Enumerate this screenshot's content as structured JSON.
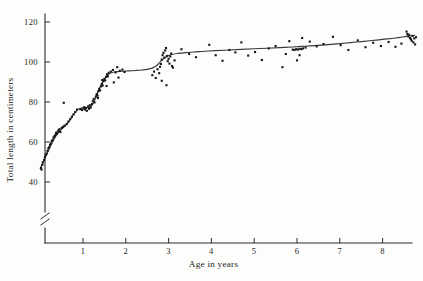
{
  "chart_data": {
    "type": "scatter",
    "title": "",
    "xlabel": "Age in years",
    "ylabel": "Total length in centimeters",
    "xlim": [
      -0.12,
      8.95
    ],
    "ylim": [
      36,
      124
    ],
    "grid": false,
    "legend": null,
    "axis_break": {
      "axis": "y",
      "below": 40,
      "symbol": "double-slash"
    },
    "xticks": [
      1,
      2,
      3,
      4,
      5,
      6,
      7,
      8
    ],
    "xtick_labels": [
      "1",
      "2",
      "3",
      "4",
      "5",
      "6",
      "7",
      "8"
    ],
    "yticks": [
      40,
      60,
      80,
      100,
      120
    ],
    "ytick_labels": [
      "40",
      "60",
      "80",
      "100",
      "120"
    ],
    "series": [
      {
        "name": "Observed lengths",
        "marker": "dot",
        "color": "#141414",
        "points": [
          [
            0.02,
            47.0
          ],
          [
            0.03,
            46.2
          ],
          [
            0.05,
            48.5
          ],
          [
            0.06,
            49.8
          ],
          [
            0.09,
            51.0
          ],
          [
            0.11,
            52.4
          ],
          [
            0.13,
            53.6
          ],
          [
            0.15,
            54.2
          ],
          [
            0.17,
            55.6
          ],
          [
            0.19,
            56.8
          ],
          [
            0.21,
            57.4
          ],
          [
            0.23,
            58.6
          ],
          [
            0.25,
            59.2
          ],
          [
            0.27,
            60.4
          ],
          [
            0.29,
            61.0
          ],
          [
            0.31,
            62.2
          ],
          [
            0.33,
            62.8
          ],
          [
            0.35,
            63.4
          ],
          [
            0.37,
            64.6
          ],
          [
            0.39,
            64.0
          ],
          [
            0.41,
            65.2
          ],
          [
            0.43,
            65.8
          ],
          [
            0.45,
            66.4
          ],
          [
            0.47,
            65.0
          ],
          [
            0.5,
            67.0
          ],
          [
            0.53,
            67.6
          ],
          [
            0.57,
            68.2
          ],
          [
            0.62,
            69.0
          ],
          [
            0.66,
            70.2
          ],
          [
            0.7,
            71.4
          ],
          [
            0.74,
            72.6
          ],
          [
            0.78,
            73.8
          ],
          [
            0.82,
            75.0
          ],
          [
            0.86,
            76.2
          ],
          [
            0.55,
            79.6
          ],
          [
            0.94,
            76.4
          ],
          [
            0.98,
            76.0
          ],
          [
            1.01,
            76.8
          ],
          [
            1.03,
            77.4
          ],
          [
            1.05,
            76.2
          ],
          [
            1.07,
            77.0
          ],
          [
            1.09,
            75.6
          ],
          [
            1.12,
            77.8
          ],
          [
            1.14,
            76.6
          ],
          [
            1.16,
            78.4
          ],
          [
            1.18,
            77.2
          ],
          [
            1.21,
            79.0
          ],
          [
            1.23,
            80.4
          ],
          [
            1.25,
            81.6
          ],
          [
            1.27,
            79.8
          ],
          [
            1.3,
            82.8
          ],
          [
            1.32,
            84.0
          ],
          [
            1.34,
            83.2
          ],
          [
            1.36,
            85.4
          ],
          [
            1.38,
            86.6
          ],
          [
            1.4,
            85.8
          ],
          [
            1.42,
            87.8
          ],
          [
            1.44,
            89.0
          ],
          [
            1.46,
            88.2
          ],
          [
            1.48,
            90.4
          ],
          [
            1.5,
            91.6
          ],
          [
            1.52,
            90.8
          ],
          [
            1.54,
            92.6
          ],
          [
            1.56,
            93.8
          ],
          [
            1.58,
            92.8
          ],
          [
            1.6,
            94.6
          ],
          [
            1.35,
            82.0
          ],
          [
            1.45,
            91.0
          ],
          [
            1.55,
            88.0
          ],
          [
            1.65,
            95.2
          ],
          [
            1.7,
            96.0
          ],
          [
            1.76,
            94.8
          ],
          [
            1.8,
            97.4
          ],
          [
            1.86,
            95.6
          ],
          [
            1.92,
            96.2
          ],
          [
            1.97,
            95.0
          ],
          [
            1.72,
            89.8
          ],
          [
            1.83,
            92.2
          ],
          [
            2.62,
            93.4
          ],
          [
            2.66,
            95.2
          ],
          [
            2.7,
            92.0
          ],
          [
            2.74,
            96.4
          ],
          [
            2.78,
            94.4
          ],
          [
            2.8,
            97.6
          ],
          [
            2.82,
            99.0
          ],
          [
            2.84,
            101.2
          ],
          [
            2.86,
            103.4
          ],
          [
            2.88,
            104.6
          ],
          [
            2.9,
            102.2
          ],
          [
            2.92,
            105.8
          ],
          [
            2.94,
            107.0
          ],
          [
            2.96,
            103.0
          ],
          [
            2.98,
            100.4
          ],
          [
            3.0,
            101.6
          ],
          [
            3.02,
            99.2
          ],
          [
            3.04,
            102.8
          ],
          [
            3.06,
            104.2
          ],
          [
            3.08,
            98.0
          ],
          [
            2.84,
            90.6
          ],
          [
            2.95,
            88.4
          ],
          [
            3.1,
            97.2
          ],
          [
            3.14,
            100.8
          ],
          [
            3.3,
            106.4
          ],
          [
            3.48,
            104.0
          ],
          [
            3.64,
            102.4
          ],
          [
            3.95,
            108.6
          ],
          [
            4.1,
            103.4
          ],
          [
            4.26,
            100.6
          ],
          [
            4.42,
            106.0
          ],
          [
            4.56,
            104.8
          ],
          [
            4.7,
            109.8
          ],
          [
            4.86,
            103.2
          ],
          [
            5.02,
            105.0
          ],
          [
            5.18,
            101.0
          ],
          [
            5.34,
            106.8
          ],
          [
            5.5,
            108.0
          ],
          [
            5.66,
            97.4
          ],
          [
            5.74,
            104.0
          ],
          [
            5.82,
            110.4
          ],
          [
            5.9,
            106.2
          ],
          [
            5.94,
            106.0
          ],
          [
            5.98,
            106.4
          ],
          [
            6.02,
            106.2
          ],
          [
            6.06,
            106.6
          ],
          [
            6.1,
            106.4
          ],
          [
            6.14,
            106.8
          ],
          [
            6.2,
            107.2
          ],
          [
            6.0,
            100.8
          ],
          [
            6.06,
            103.4
          ],
          [
            6.12,
            112.0
          ],
          [
            6.3,
            110.2
          ],
          [
            6.46,
            107.8
          ],
          [
            6.62,
            109.0
          ],
          [
            6.84,
            112.6
          ],
          [
            7.02,
            108.4
          ],
          [
            7.2,
            106.0
          ],
          [
            7.42,
            110.8
          ],
          [
            7.6,
            107.4
          ],
          [
            7.78,
            109.6
          ],
          [
            7.96,
            108.0
          ],
          [
            8.14,
            110.0
          ],
          [
            8.3,
            107.6
          ],
          [
            8.44,
            109.2
          ],
          [
            8.56,
            115.2
          ],
          [
            8.58,
            114.0
          ],
          [
            8.6,
            112.8
          ],
          [
            8.62,
            113.6
          ],
          [
            8.64,
            112.0
          ],
          [
            8.66,
            111.4
          ],
          [
            8.68,
            110.6
          ],
          [
            8.7,
            113.0
          ],
          [
            8.72,
            109.8
          ],
          [
            8.74,
            111.8
          ],
          [
            8.76,
            108.8
          ],
          [
            8.78,
            112.4
          ]
        ]
      }
    ],
    "fit_curve": {
      "name": "Fitted growth curve",
      "color": "#3a3a3a",
      "description": "Stepped growth curve with plateaus and rapid transitions",
      "points": [
        [
          0.0,
          46.8
        ],
        [
          0.05,
          49.0
        ],
        [
          0.1,
          51.4
        ],
        [
          0.16,
          54.2
        ],
        [
          0.22,
          57.0
        ],
        [
          0.28,
          59.6
        ],
        [
          0.34,
          62.0
        ],
        [
          0.4,
          64.0
        ],
        [
          0.46,
          65.6
        ],
        [
          0.52,
          66.8
        ],
        [
          0.58,
          68.0
        ],
        [
          0.64,
          69.4
        ],
        [
          0.7,
          71.2
        ],
        [
          0.76,
          73.2
        ],
        [
          0.82,
          75.0
        ],
        [
          0.88,
          76.2
        ],
        [
          0.94,
          76.8
        ],
        [
          1.0,
          77.1
        ],
        [
          1.06,
          77.2
        ],
        [
          1.12,
          77.3
        ],
        [
          1.18,
          77.6
        ],
        [
          1.24,
          79.4
        ],
        [
          1.3,
          82.4
        ],
        [
          1.36,
          85.6
        ],
        [
          1.42,
          88.4
        ],
        [
          1.48,
          90.8
        ],
        [
          1.54,
          92.6
        ],
        [
          1.6,
          93.8
        ],
        [
          1.66,
          94.6
        ],
        [
          1.74,
          95.0
        ],
        [
          1.82,
          95.2
        ],
        [
          1.92,
          95.4
        ],
        [
          2.02,
          95.5
        ],
        [
          2.14,
          95.6
        ],
        [
          2.26,
          95.8
        ],
        [
          2.38,
          96.0
        ],
        [
          2.5,
          96.3
        ],
        [
          2.6,
          96.8
        ],
        [
          2.68,
          97.6
        ],
        [
          2.76,
          99.0
        ],
        [
          2.84,
          100.8
        ],
        [
          2.92,
          102.2
        ],
        [
          3.0,
          103.2
        ],
        [
          3.1,
          103.9
        ],
        [
          3.22,
          104.3
        ],
        [
          3.4,
          104.7
        ],
        [
          3.6,
          105.0
        ],
        [
          3.85,
          105.4
        ],
        [
          4.1,
          105.7
        ],
        [
          4.4,
          106.0
        ],
        [
          4.7,
          106.3
        ],
        [
          5.0,
          106.6
        ],
        [
          5.3,
          106.9
        ],
        [
          5.6,
          107.2
        ],
        [
          5.9,
          107.5
        ],
        [
          6.2,
          107.9
        ],
        [
          6.5,
          108.3
        ],
        [
          6.8,
          108.8
        ],
        [
          7.1,
          109.4
        ],
        [
          7.4,
          110.0
        ],
        [
          7.7,
          110.6
        ],
        [
          8.0,
          111.3
        ],
        [
          8.3,
          112.0
        ],
        [
          8.55,
          112.8
        ],
        [
          8.75,
          113.4
        ]
      ]
    }
  }
}
